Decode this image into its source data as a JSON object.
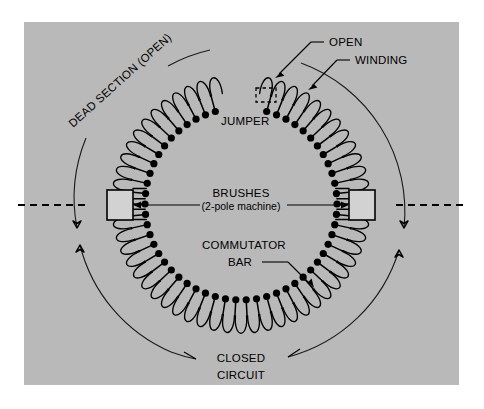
{
  "figure": {
    "panel": {
      "x": 24,
      "y": 22,
      "width": 435,
      "height": 363,
      "color": "#b9b9b9"
    },
    "canvas": {
      "width": 484,
      "height": 409,
      "background": "#ffffff"
    }
  },
  "geometry": {
    "center": {
      "x": 241,
      "y": 204
    },
    "coil_outer_radius": 131,
    "coil_inner_radius": 112,
    "bar_dot_radius": 96,
    "bar_dot_size": 3.6,
    "segment_count": 58,
    "gap_start_deg": -101,
    "gap_end_deg": -79,
    "outer_arc_radius": 158,
    "stroke_color": "#000000"
  },
  "labels": {
    "dead_section": "DEAD SECTION (OPEN)",
    "open": "OPEN",
    "winding": "WINDING",
    "jumper": "JUMPER",
    "brushes": "BRUSHES",
    "brushes_sub": "(2-pole machine)",
    "commutator_line1": "COMMUTATOR",
    "commutator_line2": "BAR",
    "closed_line1": "CLOSED",
    "closed_line2": "CIRCUIT"
  },
  "brushes": {
    "left": {
      "x": 107,
      "y": 190,
      "width": 26,
      "height": 30
    },
    "right": {
      "x": 349,
      "y": 190,
      "width": 26,
      "height": 30
    },
    "fill": "#d2d2d2"
  },
  "jumper_box": {
    "x": 256,
    "y": 88,
    "width": 20,
    "height": 14
  },
  "axis": {
    "left_line": {
      "x1": 18,
      "y1": 205,
      "x2": 86,
      "y2": 205
    },
    "right_line": {
      "x1": 396,
      "y1": 205,
      "x2": 466,
      "y2": 205
    }
  }
}
